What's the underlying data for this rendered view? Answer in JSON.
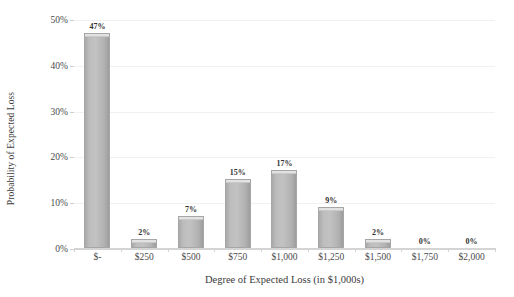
{
  "chart_data": {
    "type": "bar",
    "title": "",
    "xlabel": "Degree of Expected Loss (in $1,000s)",
    "ylabel": "Probability of Expected Loss",
    "categories": [
      "$-",
      "$250",
      "$500",
      "$750",
      "$1,000",
      "$1,250",
      "$1,500",
      "$1,750",
      "$2,000"
    ],
    "values": [
      47,
      2,
      7,
      15,
      17,
      9,
      2,
      0,
      0
    ],
    "data_labels": [
      "47%",
      "2%",
      "7%",
      "15%",
      "17%",
      "9%",
      "2%",
      "0%",
      "0%"
    ],
    "ylim": [
      0,
      50
    ],
    "ytick_values": [
      0,
      10,
      20,
      30,
      40,
      50
    ],
    "ytick_labels": [
      "0%",
      "10%",
      "20%",
      "30%",
      "40%",
      "50%"
    ],
    "grid": true,
    "grid_axis": "y",
    "legend": false,
    "legend_position": "none",
    "bar_color": "#b8b8b8",
    "bar_edge_color": "#a6a6a6",
    "bar_cap_color": "#e2e2e2",
    "gridline_color": "#f1f1f1",
    "axis_line_color": "#d4d4d4",
    "text_color": "#3b3b3b",
    "background_color": "#ffffff"
  }
}
